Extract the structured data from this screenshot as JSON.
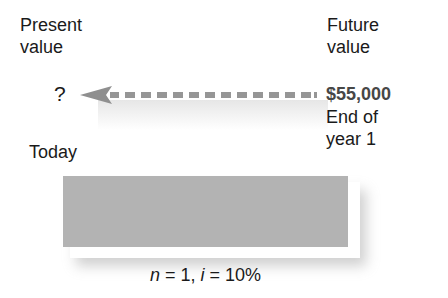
{
  "present_value": {
    "title_line1": "Present",
    "title_line2": "value",
    "amount": "?",
    "time_label": "Today"
  },
  "future_value": {
    "title_line1": "Future",
    "title_line2": "value",
    "amount": "$55,000",
    "time_label_line1": "End of",
    "time_label_line2": "year 1"
  },
  "arrow": {
    "direction": "left",
    "style": "dashed",
    "color": "#8f8f8f"
  },
  "timeline_bar": {
    "color": "#b3b3b3"
  },
  "formula": {
    "n_var": "n",
    "n_eq": " = 1, ",
    "i_var": "i",
    "i_eq": " = 10%"
  }
}
